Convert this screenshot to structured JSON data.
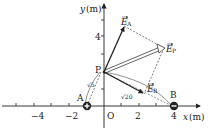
{
  "diagram": {
    "axes": {
      "x_label": "x",
      "x_unit": "(m)",
      "y_label": "y",
      "y_unit": "(m)",
      "origin_label": "O",
      "x_ticks": [
        "−4",
        "−2",
        "2",
        "4"
      ],
      "y_ticks": [
        "4"
      ]
    },
    "points": {
      "A": {
        "label": "A",
        "x": -1,
        "y": 0,
        "charge": "+"
      },
      "B": {
        "label": "B",
        "x": 4,
        "y": 0,
        "charge": "−"
      },
      "P": {
        "label": "P",
        "x": 0,
        "y": 2
      }
    },
    "distances": {
      "AP": "√5",
      "BP": "√20"
    },
    "vectors": {
      "EA": {
        "label": "E",
        "subscript": "A"
      },
      "EB": {
        "label": "E",
        "subscript": "B"
      },
      "EP": {
        "label": "E",
        "subscript": "P"
      }
    },
    "colors": {
      "line": "#222222",
      "background": "#ffffff"
    }
  }
}
